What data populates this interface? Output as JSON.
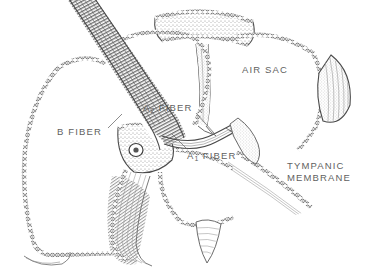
{
  "figure": {
    "style": "grayscale stippled line drawing",
    "background_color": "#ffffff",
    "ink_color": "#4a4a4a",
    "label_color": "#5f5f5f",
    "fill_color": "#ffffff",
    "stipple_color": "#9a9a9a"
  },
  "labels": {
    "air_sac": "AIR SAC",
    "a2_fiber_prefix": "A",
    "a2_fiber_sub": "2",
    "a2_fiber_suffix": " FIBER",
    "a1_fiber_prefix": "A",
    "a1_fiber_sub": "1",
    "a1_fiber_suffix": " FIBER",
    "b_fiber": "B FIBER",
    "tympanic_line1": "TYMPANIC",
    "tympanic_line2": "MEMBRANE"
  },
  "structures": {
    "nerve_bundle": "striated nerve trunk entering from top-left",
    "junction": "central ganglion where A and B fibers separate",
    "top_arch": "stippled arch sac at top center",
    "right_attachment": "tapered leaf-shaped attachment at right",
    "bottom_fold": "tapered membrane fold at bottom center",
    "left_fold": "striated membrane fold at lower left"
  }
}
